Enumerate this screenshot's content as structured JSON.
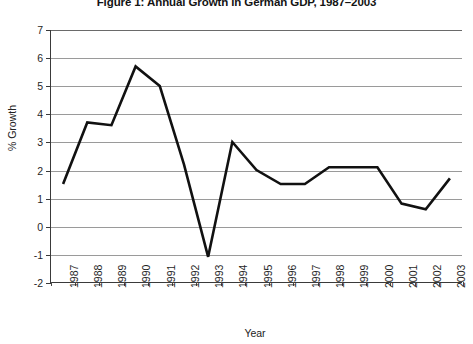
{
  "chart_data": {
    "type": "line",
    "title": "Figure 1: Annual Growth in German GDP, 1987–2003",
    "xlabel": "Year",
    "ylabel": "% Growth",
    "categories": [
      "1987",
      "1988",
      "1989",
      "1990",
      "1991",
      "1992",
      "1993",
      "1994",
      "1995",
      "1996",
      "1997",
      "1998",
      "1999",
      "2000",
      "2001",
      "2002",
      "2003"
    ],
    "values": [
      1.5,
      3.7,
      3.6,
      5.7,
      5.0,
      2.2,
      -1.1,
      3.0,
      2.0,
      1.5,
      1.5,
      2.1,
      2.1,
      2.1,
      0.8,
      0.6,
      1.7
    ],
    "series": [
      {
        "name": "Annual Growth in German GDP",
        "values": [
          1.5,
          3.7,
          3.6,
          5.7,
          5.0,
          2.2,
          -1.1,
          3.0,
          2.0,
          1.5,
          1.5,
          2.1,
          2.1,
          2.1,
          0.8,
          0.6,
          1.7
        ]
      }
    ],
    "ylim": [
      -2,
      7
    ],
    "ytick_values": [
      7,
      6,
      5,
      4,
      3,
      2,
      1,
      0,
      -1,
      -2
    ],
    "ytick_labels": [
      "7",
      "6",
      "5",
      "4",
      "3",
      "2",
      "1",
      "0",
      "-1",
      "-2"
    ],
    "xtick_labels": [
      "1987",
      "1988",
      "1989",
      "1990",
      "1991",
      "1992",
      "1993",
      "1994",
      "1995",
      "1996",
      "1997",
      "1998",
      "1999",
      "2000",
      "2001",
      "2002",
      "2003"
    ],
    "grid": true,
    "grid_axis": "y",
    "legend": false,
    "legend_position": "none",
    "line_color": "#111111",
    "grid_color": "#9a9a9a",
    "axis_color": "#3a3a3a",
    "background_color": "#ffffff",
    "markers": false,
    "line_width": 2.6
  }
}
